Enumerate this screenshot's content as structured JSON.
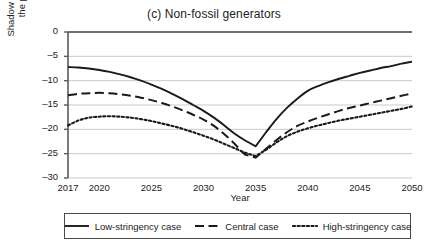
{
  "chart_data": {
    "type": "line",
    "title": "(c) Non-fossil generators",
    "xlabel": "Year",
    "ylabel": "Shadow tax as a percent of\nthe producer price",
    "xlim": [
      2017,
      2050
    ],
    "ylim": [
      -30,
      0
    ],
    "grid": true,
    "xticks": [
      2017,
      2020,
      2025,
      2030,
      2035,
      2040,
      2045,
      2050
    ],
    "xtick_labels": [
      "2017",
      "2020",
      "2025",
      "2030",
      "2035",
      "2040",
      "2045",
      "2050"
    ],
    "yticks": [
      0,
      -5,
      -10,
      -15,
      -20,
      -25,
      -30
    ],
    "ytick_labels": [
      "0",
      "–5",
      "–10",
      "–15",
      "–20",
      "–25",
      "–30"
    ],
    "legend_position": "below-axes",
    "x": [
      2017,
      2018,
      2019,
      2020,
      2021,
      2022,
      2023,
      2024,
      2025,
      2026,
      2027,
      2028,
      2029,
      2030,
      2031,
      2032,
      2033,
      2034,
      2035,
      2036,
      2037,
      2038,
      2039,
      2040,
      2041,
      2042,
      2043,
      2044,
      2045,
      2046,
      2047,
      2048,
      2049,
      2050
    ],
    "series": [
      {
        "name": "Low-stringency case",
        "style": "solid",
        "color": "#1a1a1a",
        "values": [
          -7.2,
          -7.3,
          -7.5,
          -7.8,
          -8.2,
          -8.7,
          -9.3,
          -10.0,
          -10.8,
          -11.7,
          -12.7,
          -13.8,
          -15.0,
          -16.2,
          -17.6,
          -19.2,
          -20.9,
          -22.3,
          -23.5,
          -20.6,
          -17.9,
          -15.6,
          -13.7,
          -12.1,
          -11.1,
          -10.3,
          -9.6,
          -9.0,
          -8.4,
          -7.9,
          -7.4,
          -7.0,
          -6.5,
          -6.1
        ]
      },
      {
        "name": "Central case",
        "style": "dashed",
        "color": "#1a1a1a",
        "values": [
          -13.0,
          -12.7,
          -12.6,
          -12.5,
          -12.6,
          -12.8,
          -13.1,
          -13.5,
          -14.0,
          -14.6,
          -15.3,
          -16.1,
          -17.0,
          -18.0,
          -19.3,
          -21.0,
          -23.0,
          -25.2,
          -25.8,
          -24.0,
          -22.2,
          -20.6,
          -19.3,
          -18.4,
          -17.6,
          -16.9,
          -16.2,
          -15.6,
          -15.1,
          -14.6,
          -14.1,
          -13.6,
          -13.1,
          -12.6
        ]
      },
      {
        "name": "High-stringency case",
        "style": "dotted",
        "color": "#1a1a1a",
        "values": [
          -19.2,
          -18.2,
          -17.6,
          -17.4,
          -17.3,
          -17.4,
          -17.6,
          -17.9,
          -18.3,
          -18.8,
          -19.3,
          -19.9,
          -20.6,
          -21.3,
          -22.1,
          -23.0,
          -23.9,
          -24.8,
          -25.5,
          -24.2,
          -22.7,
          -21.4,
          -20.5,
          -19.8,
          -19.2,
          -18.7,
          -18.2,
          -17.8,
          -17.4,
          -17.0,
          -16.6,
          -16.2,
          -15.8,
          -15.3
        ]
      }
    ]
  },
  "legend": {
    "items": [
      {
        "label": "Low-stringency case",
        "style": "solid"
      },
      {
        "label": "Central case",
        "style": "dashed"
      },
      {
        "label": "High-stringency case",
        "style": "dotted"
      }
    ]
  }
}
